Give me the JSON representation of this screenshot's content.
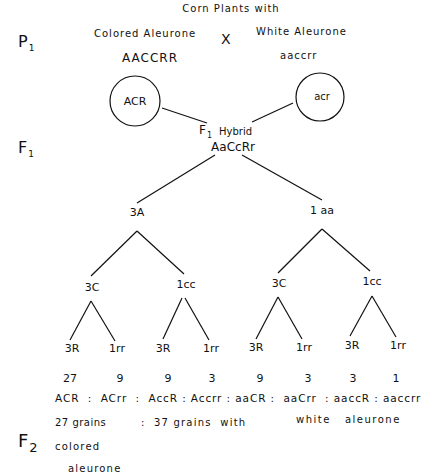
{
  "title": "Corn Plants with",
  "generations": {
    "p1": {
      "letter": "P",
      "sub": "1"
    },
    "f1": {
      "letter": "F",
      "sub": "1"
    },
    "f2": {
      "letter": "F",
      "sub": "2"
    }
  },
  "parents": {
    "left": {
      "phenotype": "Colored Aleurone",
      "genotype": "AACCRR",
      "gamete": "ACR"
    },
    "cross": "X",
    "right": {
      "phenotype": "White Aleurone",
      "genotype": "aaccrr",
      "gamete": "acr"
    }
  },
  "hybrid": {
    "prefix_letter": "F",
    "prefix_sub": "1",
    "label": "Hybrid",
    "genotype": "AaCcRr"
  },
  "tree": {
    "level1": [
      "3A",
      "1 aa"
    ],
    "level2": [
      "3C",
      "1cc",
      "3C",
      "1cc"
    ],
    "level3": [
      "3R",
      "1rr",
      "3R",
      "1rr",
      "3R",
      "1rr",
      "3R",
      "1rr"
    ]
  },
  "ratios": {
    "counts": [
      "27",
      "9",
      "9",
      "3",
      "9",
      "3",
      "3",
      "1"
    ],
    "genotype_line": "ACR  :  ACrr  :  AccR : Accrr : aaCR :  aaCrr  : aaccR : aaccrr"
  },
  "summary": {
    "colored_count": "27 grains",
    "separator": ":",
    "white_text": "37 grains  with",
    "white_text2": "white   aleurone",
    "colored_line1": "colored",
    "colored_line2": "aleurone"
  }
}
